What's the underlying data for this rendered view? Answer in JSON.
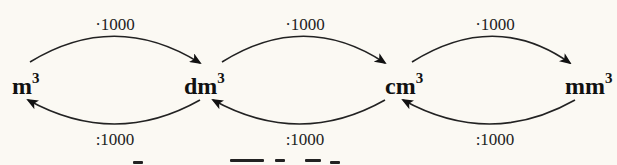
{
  "diagram": {
    "units": [
      {
        "base": "m",
        "exp": "3"
      },
      {
        "base": "dm",
        "exp": "3"
      },
      {
        "base": "cm",
        "exp": "3"
      },
      {
        "base": "mm",
        "exp": "3"
      }
    ],
    "forward_factors": [
      "·1000",
      "·1000",
      "·1000"
    ],
    "backward_factors": [
      ":1000",
      ":1000",
      ":1000"
    ],
    "colors": {
      "background": "#fbf9f3",
      "ink": "#111111"
    }
  }
}
